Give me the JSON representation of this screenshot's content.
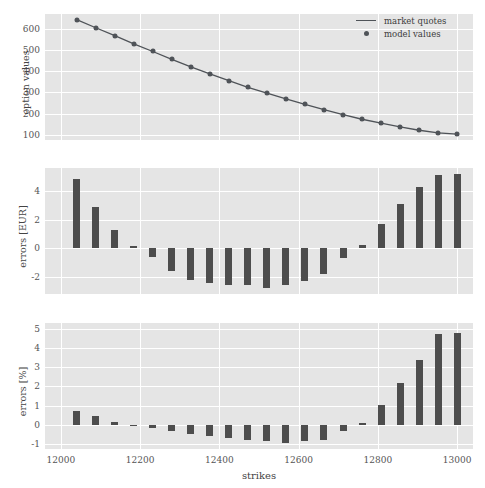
{
  "figure": {
    "background": "#ffffff",
    "panel_background": "#E5E5E5",
    "grid_color": "#ffffff",
    "series_color": "#4F5358",
    "bar_color": "#4D4D4D"
  },
  "legend": {
    "position": "upper-right",
    "entries": [
      {
        "label": "market quotes",
        "marker": "line"
      },
      {
        "label": "model values",
        "marker": "dot"
      }
    ]
  },
  "axes": {
    "xlabel": "strikes",
    "xticks": [
      12000,
      12200,
      12400,
      12600,
      12800,
      13000
    ],
    "xlim": [
      11960,
      13040
    ]
  },
  "chart_data": [
    {
      "type": "line",
      "title": "",
      "xlabel": "",
      "ylabel": "option values",
      "xlim": [
        11960,
        13040
      ],
      "ylim": [
        75,
        670
      ],
      "yticks": [
        100,
        200,
        300,
        400,
        500,
        600
      ],
      "xticks": [
        12000,
        12200,
        12400,
        12600,
        12800,
        13000
      ],
      "grid": true,
      "legend": [
        "market quotes",
        "model values"
      ],
      "x": [
        12040,
        12088,
        12136,
        12184,
        12232,
        12280,
        12328,
        12376,
        12424,
        12472,
        12520,
        12568,
        12616,
        12664,
        12712,
        12760,
        12808,
        12856,
        12904,
        12952,
        13000
      ],
      "series": [
        {
          "name": "market quotes",
          "values": [
            643,
            605,
            568,
            529,
            493,
            456,
            420,
            387,
            355,
            324,
            296,
            269,
            243,
            218,
            195,
            173,
            155,
            137,
            121,
            109,
            103
          ]
        },
        {
          "name": "model values",
          "values": [
            643,
            605,
            568,
            529,
            493,
            456,
            420,
            387,
            355,
            324,
            296,
            269,
            243,
            218,
            195,
            173,
            155,
            137,
            121,
            109,
            103
          ]
        }
      ]
    },
    {
      "type": "bar",
      "title": "",
      "xlabel": "",
      "ylabel": "errors [EUR]",
      "xlim": [
        11960,
        13040
      ],
      "ylim": [
        -3.2,
        5.6
      ],
      "yticks": [
        -2,
        0,
        2,
        4
      ],
      "xticks": [
        12000,
        12200,
        12400,
        12600,
        12800,
        13000
      ],
      "grid": true,
      "categories": [
        12040,
        12088,
        12136,
        12184,
        12232,
        12280,
        12328,
        12376,
        12424,
        12472,
        12520,
        12568,
        12616,
        12664,
        12712,
        12760,
        12808,
        12856,
        12904,
        12952,
        13000
      ],
      "values": [
        4.8,
        2.9,
        1.3,
        0.15,
        -0.65,
        -1.6,
        -2.2,
        -2.45,
        -2.55,
        -2.6,
        -2.75,
        -2.6,
        -2.3,
        -1.8,
        -0.7,
        0.25,
        1.7,
        3.1,
        4.3,
        5.1,
        5.15
      ]
    },
    {
      "type": "bar",
      "title": "",
      "xlabel": "strikes",
      "ylabel": "errors [%]",
      "xlim": [
        11960,
        13040
      ],
      "ylim": [
        -1.25,
        5.3
      ],
      "yticks": [
        -1,
        0,
        1,
        2,
        3,
        4,
        5
      ],
      "xticks": [
        12000,
        12200,
        12400,
        12600,
        12800,
        13000
      ],
      "grid": true,
      "categories": [
        12040,
        12088,
        12136,
        12184,
        12232,
        12280,
        12328,
        12376,
        12424,
        12472,
        12520,
        12568,
        12616,
        12664,
        12712,
        12760,
        12808,
        12856,
        12904,
        12952,
        13000
      ],
      "values": [
        0.75,
        0.45,
        0.15,
        -0.03,
        -0.15,
        -0.3,
        -0.45,
        -0.6,
        -0.7,
        -0.78,
        -0.85,
        -0.92,
        -0.85,
        -0.8,
        -0.3,
        0.12,
        1.05,
        2.2,
        3.4,
        4.75,
        4.8
      ]
    }
  ]
}
